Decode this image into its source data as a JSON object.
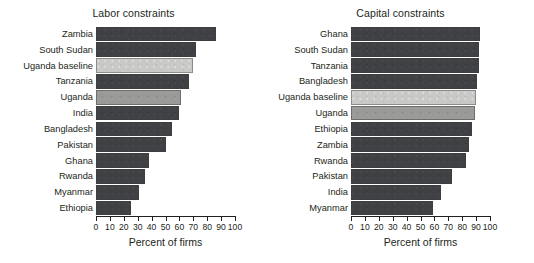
{
  "chart_data": [
    {
      "type": "bar",
      "orientation": "horizontal",
      "title": "Labor constraints",
      "xlabel": "Percent of firms",
      "ylabel": "",
      "xlim": [
        0,
        100
      ],
      "xticks": [
        0,
        10,
        20,
        30,
        40,
        50,
        60,
        70,
        80,
        90,
        100
      ],
      "grid": false,
      "legend": "none",
      "categories": [
        "Zambia",
        "South Sudan",
        "Uganda baseline",
        "Tanzania",
        "Uganda",
        "India",
        "Bangladesh",
        "Pakistan",
        "Ghana",
        "Rwanda",
        "Myanmar",
        "Ethiopia"
      ],
      "values": [
        86,
        72,
        70,
        67,
        61,
        60,
        55,
        50,
        38,
        35,
        31,
        25
      ],
      "bar_styles": [
        "dark",
        "dark",
        "light",
        "dark",
        "mid",
        "dark",
        "dark",
        "dark",
        "dark",
        "dark",
        "dark",
        "dark"
      ]
    },
    {
      "type": "bar",
      "orientation": "horizontal",
      "title": "Capital constraints",
      "xlabel": "Percent of firms",
      "ylabel": "",
      "xlim": [
        0,
        100
      ],
      "xticks": [
        0,
        10,
        20,
        30,
        40,
        50,
        60,
        70,
        80,
        90,
        100
      ],
      "grid": false,
      "legend": "none",
      "categories": [
        "Ghana",
        "South Sudan",
        "Tanzania",
        "Bangladesh",
        "Uganda baseline",
        "Uganda",
        "Ethiopia",
        "Zambia",
        "Rwanda",
        "Pakistan",
        "India",
        "Myanmar"
      ],
      "values": [
        93,
        92,
        92,
        91,
        90,
        89,
        87,
        85,
        83,
        73,
        65,
        59
      ],
      "bar_styles": [
        "dark",
        "dark",
        "dark",
        "dark",
        "light",
        "mid",
        "dark",
        "dark",
        "dark",
        "dark",
        "dark",
        "dark"
      ]
    }
  ],
  "colors": {
    "bar_dark": "#3f4144",
    "bar_light": "#c9c9c7",
    "bar_mid": "#9a9a98",
    "axis": "#231f20",
    "background": "#ffffff"
  }
}
